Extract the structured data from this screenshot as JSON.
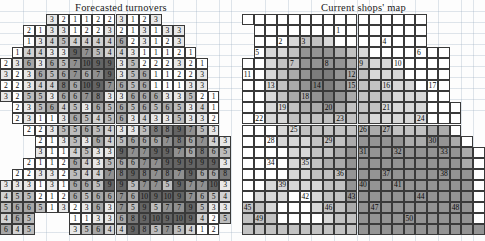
{
  "figure": {
    "kind": "two-panel-grid-figure",
    "background_color": "#fdfdfd",
    "grid_line_color": "#3a3a3a"
  },
  "panels": {
    "left": {
      "title": "Forecasted  turnovers",
      "type": "value-grid",
      "cols": 21,
      "rows": 20,
      "cell_w": 11.55,
      "cell_h": 11.05,
      "legend_note": "cell shade encodes forecasted turnover magnitude; darker = higher",
      "shade_palette": {
        "0": "#ffffff",
        "1": "#e8e8e8",
        "2": "#d2d2d2",
        "3": "#bcbcbc",
        "4": "#a6a6a6",
        "5": "#909090",
        "6": "#7a7a7a",
        "7": "#646464"
      }
    },
    "right": {
      "title": "Current shops' map",
      "type": "shop-map-grid",
      "cols": 21,
      "rows": 20,
      "cell_w": 11.55,
      "cell_h": 11.05,
      "legend_note": "numbered labels mark current shop sites; shades mark catchment density",
      "shade_palette": {
        "0": "#ffffff",
        "1": "#ededed",
        "2": "#d8d8d8",
        "3": "#c2c2c2",
        "4": "#ababab",
        "5": "#949494",
        "6": "#7d7d7d"
      }
    }
  },
  "chart_data": [
    {
      "type": "heatmap",
      "title": "Forecasted  turnovers",
      "xlabel": "",
      "ylabel": "",
      "cols": 21,
      "rows": 20,
      "value_range": [
        1,
        10
      ],
      "cells": [
        [
          null,
          null,
          null,
          null,
          "3",
          "2",
          "1",
          "1",
          "2",
          "2",
          "3",
          "1",
          "2",
          "3",
          null,
          null,
          null,
          null,
          null,
          null,
          null
        ],
        [
          null,
          null,
          "2",
          "1",
          "3",
          "3",
          "1",
          "2",
          "2",
          "3",
          "2",
          "1",
          "3",
          "1",
          "3",
          "3",
          null,
          null,
          null,
          null,
          null
        ],
        [
          null,
          null,
          "1",
          "3",
          "4",
          "5",
          "4",
          "4",
          "4",
          "4",
          "6",
          "2",
          "3",
          "1",
          "2",
          "3",
          null,
          null,
          null,
          null,
          null
        ],
        [
          null,
          "1",
          "4",
          "4",
          "3",
          "3",
          "9",
          "7",
          "5",
          "4",
          "4",
          "3",
          "1",
          "1",
          "1",
          "2",
          "1",
          null,
          null,
          null,
          null
        ],
        [
          "2",
          "3",
          "6",
          "3",
          "6",
          "5",
          "7",
          "10",
          "9",
          "9",
          "3",
          "5",
          "2",
          "2",
          "2",
          "3",
          "2",
          "1",
          null,
          null,
          null
        ],
        [
          "3",
          "2",
          "3",
          "6",
          "5",
          "6",
          "7",
          "6",
          "7",
          "9",
          "3",
          "5",
          "6",
          "1",
          "1",
          "2",
          "2",
          "3",
          null,
          null,
          null
        ],
        [
          "2",
          "2",
          "3",
          "4",
          "4",
          "8",
          "6",
          "10",
          "9",
          "7",
          "6",
          "5",
          "6",
          "1",
          "1",
          "1",
          "3",
          "3",
          null,
          null,
          null
        ],
        [
          "3",
          "2",
          "5",
          "5",
          "3",
          "6",
          "6",
          "7",
          "8",
          "3",
          "3",
          "6",
          "6",
          "6",
          "3",
          "3",
          "5",
          "2",
          "1",
          null,
          null
        ],
        [
          null,
          "2",
          "3",
          "5",
          "6",
          "4",
          "5",
          "3",
          "6",
          "5",
          "6",
          "5",
          "6",
          "5",
          "6",
          "5",
          "3",
          "4",
          "1",
          null,
          null
        ],
        [
          null,
          "2",
          "3",
          "1",
          "1",
          "3",
          "6",
          "5",
          "4",
          "5",
          "6",
          "3",
          "4",
          "3",
          "3",
          "5",
          "3",
          "3",
          "2",
          null,
          null
        ],
        [
          null,
          null,
          "2",
          "2",
          "3",
          "5",
          "5",
          "6",
          "5",
          "4",
          "3",
          "3",
          "5",
          "8",
          "8",
          "9",
          "7",
          "5",
          "3",
          null,
          null
        ],
        [
          null,
          null,
          null,
          "2",
          "1",
          "3",
          "5",
          "3",
          "6",
          "4",
          "5",
          "6",
          "6",
          "6",
          "7",
          "8",
          "6",
          "7",
          "4",
          "3",
          null
        ],
        [
          null,
          null,
          null,
          "3",
          "1",
          "1",
          "4",
          "5",
          "3",
          "3",
          "9",
          "7",
          "7",
          "9",
          "9",
          "7",
          "6",
          "8",
          "6",
          "5"
        ],
        [
          null,
          null,
          "2",
          "1",
          "1",
          "2",
          "6",
          "4",
          "3",
          "5",
          "6",
          "6",
          "7",
          "7",
          "9",
          "9",
          "9",
          "9",
          "9",
          "3"
        ],
        [
          null,
          "2",
          "2",
          "3",
          "3",
          "2",
          "5",
          "4",
          "4",
          "7",
          "8",
          "9",
          "8",
          "7",
          "8",
          "7",
          "9",
          "6",
          "6",
          "8"
        ],
        [
          "3",
          "3",
          "3",
          "1",
          "3",
          "1",
          "6",
          "6",
          "5",
          "9",
          "9",
          "5",
          "7",
          "7",
          "5",
          "9",
          "7",
          "7",
          "10",
          "3"
        ],
        [
          "4",
          "5",
          "5",
          "2",
          "1",
          "2",
          "6",
          "5",
          "6",
          "6",
          "7",
          "6",
          "10",
          "9",
          "10",
          "9",
          "7",
          "6",
          "5",
          "4"
        ],
        [
          "5",
          "6",
          "6",
          "5",
          "1",
          "3",
          "2",
          "3",
          "6",
          "3",
          "7",
          "5",
          "9",
          "5",
          "7",
          "7",
          "9",
          "5",
          "3",
          "3"
        ],
        [
          "4",
          "6",
          "5",
          null,
          null,
          null,
          "1",
          "1",
          "3",
          "3",
          "6",
          "8",
          "9",
          "10",
          "9",
          "10",
          "9",
          "4",
          "2",
          "5"
        ],
        [
          "6",
          "4",
          "5",
          null,
          null,
          null,
          "3",
          "5",
          "6",
          "4",
          "4",
          "9",
          "8",
          "5",
          "7",
          "5",
          "4",
          "1",
          "2",
          null
        ]
      ]
    },
    {
      "type": "heatmap",
      "title": "Current shops' map",
      "xlabel": "",
      "ylabel": "",
      "cols": 21,
      "rows": 20,
      "value_range": [
        1,
        50
      ],
      "shop_labels": [
        {
          "id": "1",
          "col": 8,
          "row": 1
        },
        {
          "id": "2",
          "col": 3,
          "row": 2
        },
        {
          "id": "3",
          "col": 5,
          "row": 2
        },
        {
          "id": "4",
          "col": 12,
          "row": 2
        },
        {
          "id": "5",
          "col": 1,
          "row": 3
        },
        {
          "id": "6",
          "col": 15,
          "row": 3
        },
        {
          "id": "7",
          "col": 4,
          "row": 4
        },
        {
          "id": "8",
          "col": 7,
          "row": 4
        },
        {
          "id": "9",
          "col": 10,
          "row": 4
        },
        {
          "id": "10",
          "col": 13,
          "row": 4
        },
        {
          "id": "11",
          "col": 0,
          "row": 5
        },
        {
          "id": "12",
          "col": 9,
          "row": 5
        },
        {
          "id": "13",
          "col": 2,
          "row": 6
        },
        {
          "id": "14",
          "col": 6,
          "row": 6
        },
        {
          "id": "15",
          "col": 9,
          "row": 6
        },
        {
          "id": "16",
          "col": 12,
          "row": 6
        },
        {
          "id": "17",
          "col": 16,
          "row": 6
        },
        {
          "id": "18",
          "col": 5,
          "row": 7
        },
        {
          "id": "19",
          "col": 3,
          "row": 8
        },
        {
          "id": "20",
          "col": 7,
          "row": 8
        },
        {
          "id": "21",
          "col": 12,
          "row": 8
        },
        {
          "id": "22",
          "col": 1,
          "row": 9
        },
        {
          "id": "23",
          "col": 8,
          "row": 9
        },
        {
          "id": "24",
          "col": 15,
          "row": 9
        },
        {
          "id": "25",
          "col": 4,
          "row": 10
        },
        {
          "id": "26",
          "col": 10,
          "row": 10
        },
        {
          "id": "27",
          "col": 12,
          "row": 10
        },
        {
          "id": "28",
          "col": 2,
          "row": 11
        },
        {
          "id": "29",
          "col": 7,
          "row": 11
        },
        {
          "id": "30",
          "col": 16,
          "row": 11
        },
        {
          "id": "31",
          "col": 10,
          "row": 12
        },
        {
          "id": "32",
          "col": 13,
          "row": 12
        },
        {
          "id": "33",
          "col": 17,
          "row": 12
        },
        {
          "id": "34",
          "col": 2,
          "row": 13
        },
        {
          "id": "35",
          "col": 5,
          "row": 13
        },
        {
          "id": "36",
          "col": 8,
          "row": 14
        },
        {
          "id": "37",
          "col": 12,
          "row": 14
        },
        {
          "id": "38",
          "col": 17,
          "row": 14
        },
        {
          "id": "39",
          "col": 3,
          "row": 15
        },
        {
          "id": "40",
          "col": 10,
          "row": 15
        },
        {
          "id": "41",
          "col": 13,
          "row": 15
        },
        {
          "id": "42",
          "col": 5,
          "row": 16
        },
        {
          "id": "43",
          "col": 9,
          "row": 16
        },
        {
          "id": "44",
          "col": 15,
          "row": 16
        },
        {
          "id": "45",
          "col": 0,
          "row": 17
        },
        {
          "id": "46",
          "col": 7,
          "row": 17
        },
        {
          "id": "47",
          "col": 11,
          "row": 17
        },
        {
          "id": "48",
          "col": 18,
          "row": 17
        },
        {
          "id": "49",
          "col": 1,
          "row": 18
        },
        {
          "id": "50",
          "col": 14,
          "row": 18
        }
      ]
    }
  ]
}
